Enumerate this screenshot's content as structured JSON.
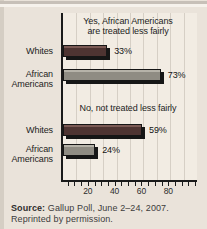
{
  "chart_data": {
    "type": "bar",
    "orientation": "horizontal",
    "question_groups": [
      {
        "title": "Yes, African Americans are treated less fairly",
        "bars": [
          {
            "category": "Whites",
            "value": 33,
            "value_label": "33%"
          },
          {
            "category": "African Americans",
            "value": 73,
            "value_label": "73%"
          }
        ]
      },
      {
        "title": "No, not treated less fairly",
        "bars": [
          {
            "category": "Whites",
            "value": 59,
            "value_label": "59%"
          },
          {
            "category": "African Americans",
            "value": 24,
            "value_label": "24%"
          }
        ]
      }
    ],
    "xlabel": "",
    "x_tick_labels": [
      20,
      40,
      60,
      80
    ],
    "xlim": [
      0,
      100
    ],
    "minor_tick_step": 5,
    "gridline_step": 10,
    "grid": "on",
    "legend": "none",
    "colors": {
      "whites_bar": "#4e3432",
      "whites_bar_highlight": "#7b5a55",
      "african_americans_bar": "#8f8c83",
      "african_americans_bar_highlight": "#b6b3a9",
      "bar_edge": "#161616",
      "plot_background": "#f2ece3",
      "panel_background": "#eae3da",
      "gridline": "#d6cfc5"
    }
  },
  "source_note": {
    "label": "Source:",
    "line1_rest": " Gallup Poll, June 2–24, 2007.",
    "line2": "Reprinted by permission."
  }
}
